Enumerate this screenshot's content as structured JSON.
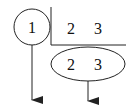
{
  "diagram": {
    "node_circle": {
      "label": "1"
    },
    "corner_box": {
      "items": [
        "2",
        "3"
      ]
    },
    "node_ellipse": {
      "items": [
        "2",
        "3"
      ]
    },
    "arrows": [
      {
        "from": "node_circle",
        "direction": "down"
      },
      {
        "from": "node_ellipse",
        "direction": "down"
      }
    ],
    "colors": {
      "stroke": "#222222",
      "text": "#111111",
      "background": "#ffffff"
    }
  }
}
